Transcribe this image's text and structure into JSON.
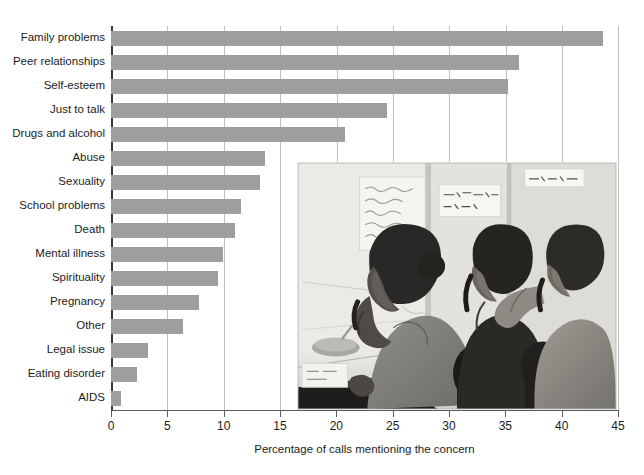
{
  "chart_data": {
    "type": "bar",
    "orientation": "horizontal",
    "title": "",
    "xlabel": "Percentage of calls mentioning the concern",
    "ylabel": "",
    "xlim": [
      0,
      45
    ],
    "xticks": [
      0,
      5,
      10,
      15,
      20,
      25,
      30,
      35,
      40,
      45
    ],
    "xtick_labels": [
      "0",
      "5",
      "10",
      "15",
      "20",
      "25",
      "30",
      "35",
      "40",
      "45"
    ],
    "grid": "vertical",
    "legend": "none",
    "bar_color": "#9e9e9e",
    "categories": [
      "Family problems",
      "Peer relationships",
      "Self-esteem",
      "Just to talk",
      "Drugs and alcohol",
      "Abuse",
      "Sexuality",
      "School problems",
      "Death",
      "Mental illness",
      "Spirituality",
      "Pregnancy",
      "Other",
      "Legal issue",
      "Eating disorder",
      "AIDS"
    ],
    "values": [
      43.7,
      36.2,
      35.2,
      24.5,
      20.8,
      13.7,
      13.2,
      11.5,
      11.0,
      9.9,
      9.5,
      7.8,
      6.4,
      3.3,
      2.3,
      0.9
    ]
  },
  "photo": {
    "caption": "",
    "alt_name": "crisis-hotline-volunteers-photo",
    "signs": [
      "LISTEN WITH CARE! SAVE A LIFE!",
      "SUICIDE HOT LINE"
    ]
  }
}
